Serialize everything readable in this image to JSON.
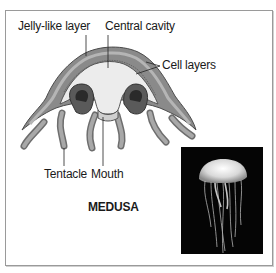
{
  "figure": {
    "title": "MEDUSA",
    "labels": {
      "jelly_like_layer": "Jelly-like layer",
      "central_cavity": "Central cavity",
      "cell_layers": "Cell layers",
      "tentacle": "Tentacle",
      "mouth": "Mouth"
    },
    "photo": {
      "subject": "jellyfish-photo",
      "background_color": "#050505"
    },
    "colors": {
      "bell_outer": "#8c8c8c",
      "bell_inner": "#e8e8e8",
      "line": "#333333"
    }
  }
}
